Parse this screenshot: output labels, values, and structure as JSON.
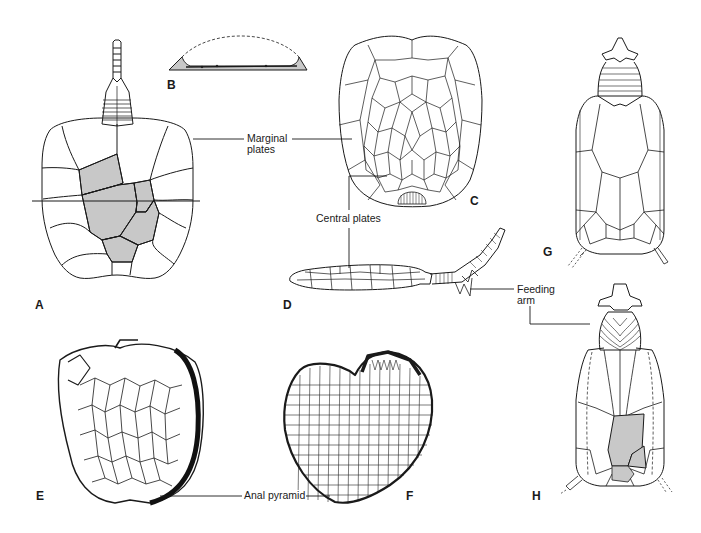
{
  "figure": {
    "panels": [
      {
        "id": "A",
        "label": "A"
      },
      {
        "id": "B",
        "label": "B"
      },
      {
        "id": "C",
        "label": "C"
      },
      {
        "id": "D",
        "label": "D"
      },
      {
        "id": "E",
        "label": "E"
      },
      {
        "id": "F",
        "label": "F"
      },
      {
        "id": "G",
        "label": "G"
      },
      {
        "id": "H",
        "label": "H"
      }
    ],
    "annotations": {
      "marginal_line1": "Marginal",
      "marginal_line2": "plates",
      "central": "Central plates",
      "feeding_line1": "Feeding",
      "feeding_line2": "arm",
      "anal": "Anal pyramid"
    },
    "colors": {
      "line": "#1a1a1a",
      "shade": "#c8c8c8",
      "background": "#ffffff"
    }
  }
}
